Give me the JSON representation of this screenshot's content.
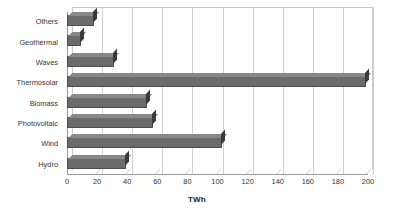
{
  "chart_data": {
    "type": "bar",
    "orientation": "horizontal",
    "title": "",
    "subtitle": "",
    "xlabel": "TWh",
    "ylabel": "",
    "categories": [
      "Others",
      "Geothermal",
      "Waves",
      "Thermosolar",
      "Biomass",
      "Photovoltaic",
      "Wind",
      "Hydro"
    ],
    "values": [
      18,
      9,
      31,
      199,
      53,
      57,
      103,
      39
    ],
    "xlim": [
      0,
      200
    ],
    "xticks": [
      0,
      20,
      40,
      60,
      80,
      100,
      120,
      140,
      160,
      180,
      200
    ],
    "xtick_labels": [
      "0",
      "20",
      "40",
      "60",
      "80",
      "100",
      "120",
      "140",
      "160",
      "180",
      "200"
    ],
    "grid": "vertical",
    "legend": false,
    "legend_position": "none",
    "style": "3d-bar",
    "bar_color": "#6b6b6b",
    "bar_edge_color": "#4d4d4d",
    "bar_cap_color": "#3a3a3a",
    "gridline_color": "#d0d0d0",
    "axis_color": "#9a9a9a",
    "background_color": "#ffffff",
    "text_color": "#333333"
  }
}
